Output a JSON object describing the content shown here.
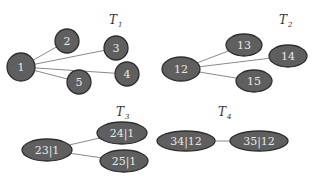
{
  "diagram": {
    "type": "forest",
    "trees": [
      {
        "id": "T1",
        "title": "T",
        "subscript": "1",
        "title_pos": [
          109,
          24
        ],
        "nodes": [
          {
            "id": "1",
            "label": "1",
            "shape": "circle",
            "cx": 21,
            "cy": 67,
            "rx": 14,
            "ry": 14
          },
          {
            "id": "2",
            "label": "2",
            "shape": "circle",
            "cx": 67,
            "cy": 41,
            "rx": 12,
            "ry": 12
          },
          {
            "id": "3",
            "label": "3",
            "shape": "circle",
            "cx": 116,
            "cy": 48,
            "rx": 12,
            "ry": 12
          },
          {
            "id": "4",
            "label": "4",
            "shape": "circle",
            "cx": 127,
            "cy": 74,
            "rx": 12,
            "ry": 12
          },
          {
            "id": "5",
            "label": "5",
            "shape": "circle",
            "cx": 79,
            "cy": 82,
            "rx": 12,
            "ry": 12
          }
        ],
        "edges": [
          [
            "1",
            "2"
          ],
          [
            "1",
            "3"
          ],
          [
            "1",
            "4"
          ],
          [
            "1",
            "5"
          ]
        ]
      },
      {
        "id": "T2",
        "title": "T",
        "subscript": "2",
        "title_pos": [
          279,
          24
        ],
        "nodes": [
          {
            "id": "12",
            "label": "12",
            "shape": "ellipse",
            "cx": 181,
            "cy": 69,
            "rx": 19,
            "ry": 12
          },
          {
            "id": "13",
            "label": "13",
            "shape": "ellipse",
            "cx": 244,
            "cy": 45,
            "rx": 18,
            "ry": 11
          },
          {
            "id": "14",
            "label": "14",
            "shape": "ellipse",
            "cx": 288,
            "cy": 56,
            "rx": 19,
            "ry": 11
          },
          {
            "id": "15",
            "label": "15",
            "shape": "ellipse",
            "cx": 254,
            "cy": 81,
            "rx": 18,
            "ry": 11
          }
        ],
        "edges": [
          [
            "12",
            "13"
          ],
          [
            "12",
            "14"
          ],
          [
            "12",
            "15"
          ]
        ]
      },
      {
        "id": "T3",
        "title": "T",
        "subscript": "3",
        "title_pos": [
          116,
          116
        ],
        "nodes": [
          {
            "id": "23|1",
            "label": "23|1",
            "shape": "ellipse",
            "cx": 47,
            "cy": 150,
            "rx": 25,
            "ry": 11
          },
          {
            "id": "24|1",
            "label": "24|1",
            "shape": "ellipse",
            "cx": 122,
            "cy": 133,
            "rx": 25,
            "ry": 11
          },
          {
            "id": "25|1",
            "label": "25|1",
            "shape": "ellipse",
            "cx": 124,
            "cy": 161,
            "rx": 24,
            "ry": 11
          }
        ],
        "edges": [
          [
            "23|1",
            "24|1"
          ],
          [
            "23|1",
            "25|1"
          ]
        ]
      },
      {
        "id": "T4",
        "title": "T",
        "subscript": "4",
        "title_pos": [
          218,
          116
        ],
        "nodes": [
          {
            "id": "34|12",
            "label": "34|12",
            "shape": "ellipse",
            "cx": 186,
            "cy": 141,
            "rx": 29,
            "ry": 10
          },
          {
            "id": "35|12",
            "label": "35|12",
            "shape": "ellipse",
            "cx": 259,
            "cy": 141,
            "rx": 29,
            "ry": 10
          }
        ],
        "edges": [
          [
            "34|12",
            "35|12"
          ]
        ]
      }
    ]
  }
}
